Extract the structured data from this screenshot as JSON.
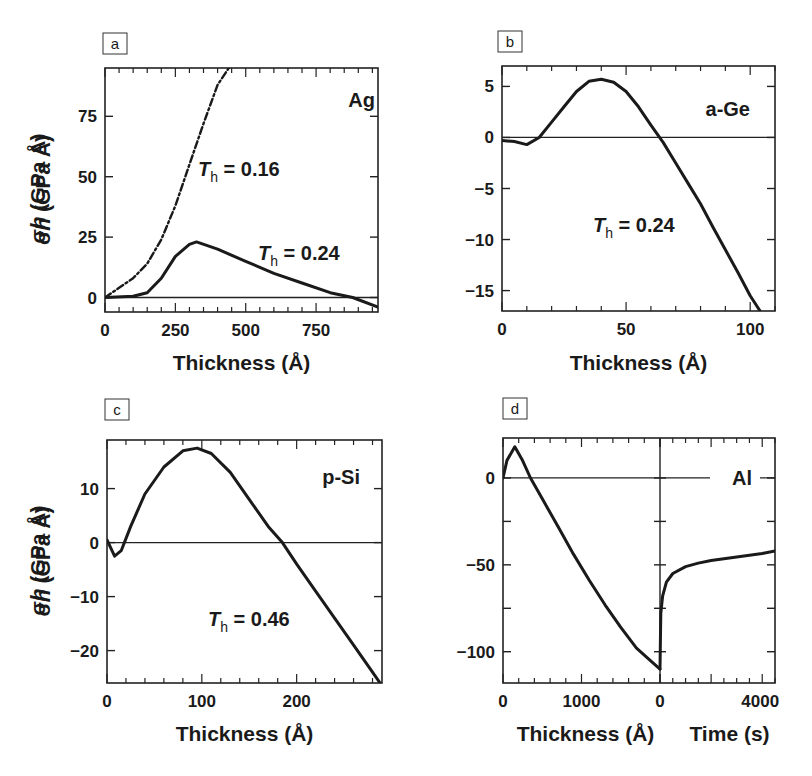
{
  "figure": {
    "panels": [
      {
        "letter": "a",
        "material": "Ag",
        "xlabel": "Thickness (Å)",
        "ylabel": "σh (GPa Å)",
        "annotations": [
          {
            "text": "T",
            "sub": "h",
            "value": " = 0.16"
          },
          {
            "text": "T",
            "sub": "h",
            "value": " = 0.24"
          }
        ]
      },
      {
        "letter": "b",
        "material": "a-Ge",
        "xlabel": "Thickness (Å)",
        "ylabel": "σh (GPa Å)",
        "annotations": [
          {
            "text": "T",
            "sub": "h",
            "value": " = 0.24"
          }
        ]
      },
      {
        "letter": "c",
        "material": "p-Si",
        "xlabel": "Thickness (Å)",
        "ylabel": "σh (GPa Å)",
        "annotations": [
          {
            "text": "T",
            "sub": "h",
            "value": " = 0.46"
          }
        ]
      },
      {
        "letter": "d",
        "material": "Al",
        "xlabel": "Thickness (Å)",
        "xlabel2": "Time (s)",
        "ylabel": "σh (GPa Å)",
        "annotations": []
      }
    ]
  },
  "chart_data": [
    {
      "type": "line",
      "title": "a",
      "label": "Ag",
      "xlabel": "Thickness (Å)",
      "ylabel": "σh (GPa Å)",
      "xlim": [
        0,
        970
      ],
      "ylim": [
        -6,
        95
      ],
      "xticks": [
        0,
        250,
        500,
        750
      ],
      "yticks": [
        0,
        25,
        50,
        75
      ],
      "series": [
        {
          "name": "T_h = 0.16",
          "style": "dashed",
          "x": [
            0,
            50,
            100,
            150,
            200,
            250,
            300,
            350,
            400,
            440
          ],
          "y": [
            0,
            4,
            8,
            14,
            24,
            38,
            55,
            72,
            88,
            95
          ]
        },
        {
          "name": "T_h = 0.24",
          "style": "solid",
          "x": [
            0,
            100,
            150,
            200,
            250,
            300,
            325,
            400,
            500,
            600,
            700,
            800,
            880,
            970
          ],
          "y": [
            0,
            0.5,
            2,
            8,
            17,
            22,
            23,
            20,
            15,
            10,
            6,
            2,
            0,
            -4
          ]
        }
      ]
    },
    {
      "type": "line",
      "title": "b",
      "label": "a-Ge",
      "xlabel": "Thickness (Å)",
      "ylabel": "σh (GPa Å)",
      "xlim": [
        0,
        110
      ],
      "ylim": [
        -17,
        7
      ],
      "xticks": [
        0,
        50,
        100
      ],
      "yticks": [
        5,
        0,
        -5,
        -10,
        -15
      ],
      "series": [
        {
          "name": "T_h = 0.24",
          "style": "solid",
          "x": [
            0,
            5,
            10,
            15,
            20,
            25,
            30,
            35,
            40,
            45,
            50,
            55,
            60,
            65,
            70,
            75,
            80,
            85,
            90,
            95,
            100,
            104
          ],
          "y": [
            -0.3,
            -0.4,
            -0.7,
            0,
            1.5,
            3,
            4.5,
            5.5,
            5.7,
            5.4,
            4.5,
            3,
            1.2,
            -0.5,
            -2.5,
            -4.5,
            -6.5,
            -8.8,
            -11,
            -13.2,
            -15.5,
            -17
          ]
        }
      ]
    },
    {
      "type": "line",
      "title": "c",
      "label": "p-Si",
      "xlabel": "Thickness (Å)",
      "ylabel": "σh (GPa Å)",
      "xlim": [
        0,
        290
      ],
      "ylim": [
        -26,
        19
      ],
      "xticks": [
        0,
        100,
        200
      ],
      "yticks": [
        10,
        0,
        -10,
        -20
      ],
      "series": [
        {
          "name": "T_h = 0.46",
          "style": "solid",
          "x": [
            0,
            8,
            15,
            25,
            40,
            60,
            80,
            95,
            110,
            130,
            150,
            170,
            185,
            200,
            220,
            240,
            260,
            280,
            288
          ],
          "y": [
            0.5,
            -2.5,
            -1.5,
            3,
            9,
            14,
            17,
            17.5,
            16.5,
            13,
            8,
            3,
            0,
            -4,
            -9,
            -14,
            -19,
            -24,
            -26
          ]
        }
      ]
    },
    {
      "type": "line",
      "title": "d",
      "label": "Al",
      "xlabel": "Thickness (Å)",
      "xlabel2": "Time (s)",
      "ylabel": "σh (GPa Å)",
      "xlim": [
        0,
        2000
      ],
      "xlim2": [
        0,
        4500
      ],
      "ylim": [
        -118,
        23
      ],
      "xticks": [
        0,
        1000
      ],
      "xticks2": [
        0,
        4000
      ],
      "yticks": [
        0,
        -50,
        -100
      ],
      "series": [
        {
          "name": "deposition",
          "style": "solid",
          "x": [
            0,
            50,
            150,
            250,
            350,
            500,
            700,
            900,
            1100,
            1300,
            1500,
            1700,
            1900,
            2000
          ],
          "y": [
            0,
            10,
            18,
            10,
            0,
            -12,
            -28,
            -44,
            -59,
            -73,
            -86,
            -98,
            -106,
            -110
          ]
        },
        {
          "name": "post-deposition",
          "style": "solid",
          "x": [
            0,
            30,
            100,
            250,
            500,
            1000,
            1500,
            2000,
            3000,
            4000,
            4500
          ],
          "y": [
            -110,
            -78,
            -68,
            -60,
            -55,
            -51,
            -49,
            -47.5,
            -45.5,
            -43.5,
            -42
          ]
        }
      ]
    }
  ]
}
